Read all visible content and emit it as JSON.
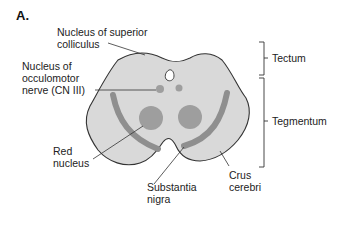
{
  "figure": {
    "panel_label": "A.",
    "colors": {
      "tissue_fill": "#d9d9d9",
      "outline": "#333333",
      "substantia_nigra_band": "#8f8f8f",
      "nuclei": "#9e9e9e",
      "aqueduct": "#ffffff",
      "leader_lines": "#333333"
    },
    "labels": {
      "superior_colliculus_line1": "Nucleus of superior",
      "superior_colliculus_line2": "colliculus",
      "oculomotor_line1": "Nucleus of",
      "oculomotor_line2": "occulomotor",
      "oculomotor_line3": "nerve (CN III)",
      "red_nucleus_line1": "Red",
      "red_nucleus_line2": "nucleus",
      "substantia_nigra_line1": "Substantia",
      "substantia_nigra_line2": "nigra",
      "crus_cerebri_line1": "Crus",
      "crus_cerebri_line2": "cerebri"
    },
    "brackets": {
      "tectum": "Tectum",
      "tegmentum": "Tegmentum"
    }
  }
}
